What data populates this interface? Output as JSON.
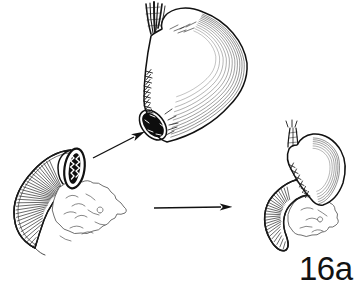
{
  "figure": {
    "label": "16a"
  },
  "colors": {
    "ink": "#1a1a1a",
    "paper": "#ffffff"
  }
}
